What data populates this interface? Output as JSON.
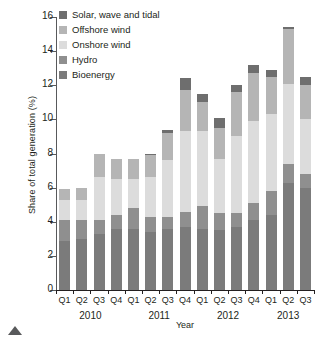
{
  "chart_data": {
    "type": "bar",
    "stacked": true,
    "title": "",
    "xlabel": "Year",
    "ylabel": "Share of total generation (%)",
    "ylim": [
      0,
      16
    ],
    "yticks": [
      0,
      2,
      4,
      6,
      8,
      10,
      12,
      14,
      16
    ],
    "grid": false,
    "legend_position": "top-left",
    "categories": [
      "Q1",
      "Q2",
      "Q3",
      "Q4",
      "Q1",
      "Q2",
      "Q3",
      "Q4",
      "Q1",
      "Q2",
      "Q3",
      "Q4",
      "Q1",
      "Q2",
      "Q3"
    ],
    "year_groups": [
      {
        "label": "2010",
        "start": 0,
        "count": 4
      },
      {
        "label": "2011",
        "start": 4,
        "count": 4
      },
      {
        "label": "2012",
        "start": 8,
        "count": 4
      },
      {
        "label": "2013",
        "start": 12,
        "count": 3
      }
    ],
    "series": [
      {
        "name": "Bioenergy",
        "color": "#7b7b7b",
        "values": [
          2.9,
          3.0,
          3.3,
          3.6,
          3.6,
          3.4,
          3.6,
          3.7,
          3.6,
          3.5,
          3.7,
          4.1,
          4.4,
          6.3,
          6.0
        ]
      },
      {
        "name": "Hydro",
        "color": "#8f8f8f",
        "values": [
          1.2,
          1.1,
          0.8,
          0.8,
          1.2,
          0.9,
          0.7,
          0.9,
          1.3,
          1.0,
          0.8,
          1.0,
          1.4,
          1.1,
          0.8
        ]
      },
      {
        "name": "Onshore wind",
        "color": "#dcdcdc",
        "values": [
          1.2,
          1.2,
          2.5,
          2.1,
          1.7,
          2.3,
          3.3,
          4.7,
          4.4,
          3.2,
          4.5,
          4.8,
          4.5,
          4.7,
          3.2
        ]
      },
      {
        "name": "Offshore wind",
        "color": "#b5b5b5",
        "values": [
          0.6,
          0.7,
          1.4,
          1.2,
          1.2,
          1.3,
          1.6,
          2.4,
          1.7,
          1.8,
          2.6,
          2.8,
          2.2,
          3.2,
          2.0
        ]
      },
      {
        "name": "Solar, wave and tidal",
        "color": "#6e6e6e",
        "values": [
          0.0,
          0.0,
          0.0,
          0.0,
          0.0,
          0.1,
          0.2,
          0.7,
          0.5,
          0.6,
          0.4,
          0.5,
          0.4,
          0.1,
          0.5
        ]
      }
    ],
    "totals": [
      5.9,
      6.0,
      8.0,
      7.7,
      7.7,
      8.0,
      9.4,
      12.4,
      11.5,
      10.1,
      12.0,
      13.2,
      12.9,
      15.4,
      12.5
    ]
  },
  "legend": {
    "items": [
      {
        "label": "Solar, wave and tidal",
        "color": "#6e6e6e"
      },
      {
        "label": "Offshore wind",
        "color": "#b5b5b5"
      },
      {
        "label": "Onshore wind",
        "color": "#dcdcdc"
      },
      {
        "label": "Hydro",
        "color": "#8f8f8f"
      },
      {
        "label": "Bioenergy",
        "color": "#7b7b7b"
      }
    ]
  },
  "axes": {
    "y_title": "Share of total generation (%)",
    "x_title": "Year",
    "y_tick_labels": [
      "16",
      "14",
      "12",
      "10",
      "8",
      "6",
      "4",
      "2",
      "0"
    ]
  }
}
